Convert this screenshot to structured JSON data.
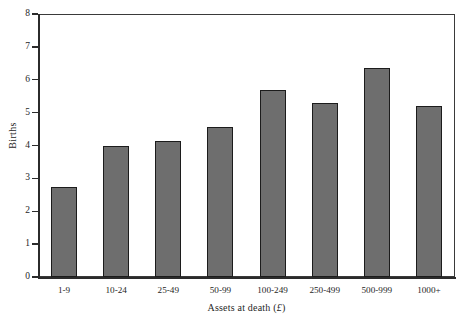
{
  "chart_data": {
    "type": "bar",
    "title": "",
    "subtitle": "",
    "xlabel": "Assets at death (£)",
    "ylabel": "Births",
    "categories": [
      "1-9",
      "10-24",
      "25-49",
      "50-99",
      "100-249",
      "250-499",
      "500-999",
      "1000+"
    ],
    "values": [
      2.75,
      4.0,
      4.15,
      4.55,
      5.7,
      5.3,
      6.35,
      5.2
    ],
    "ylim": [
      0,
      8
    ],
    "yticks": [
      0,
      1,
      2,
      3,
      4,
      5,
      6,
      7,
      8
    ],
    "ytick_labels": [
      "0",
      "1",
      "2",
      "3",
      "4",
      "5",
      "6",
      "7",
      "8"
    ],
    "grid": false,
    "legend": null,
    "bar_color": "#6e6e6e",
    "bar_edge_color": "#1c1c1c",
    "frame_color": "#3a3a3a",
    "background": "#ffffff"
  },
  "axis": {
    "x_title_main": "Assets at death (",
    "x_title_currency": "£",
    "x_title_close": ")",
    "y_title": "Births"
  }
}
